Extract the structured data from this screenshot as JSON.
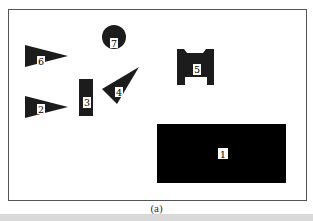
{
  "figure": {
    "caption": "(a)",
    "colors": {
      "frame": "#555555",
      "shape_fill": "#1c1c1c",
      "rect1_fill": "#000000",
      "label_bg": "#ffffff",
      "band": "#d9d9d9"
    },
    "shapes": [
      {
        "id": "1",
        "type": "rectangle",
        "label": "1"
      },
      {
        "id": "2",
        "type": "triangle",
        "label": "2"
      },
      {
        "id": "3",
        "type": "rectangle",
        "label": "3"
      },
      {
        "id": "4",
        "type": "triangle",
        "label": "4"
      },
      {
        "id": "5",
        "type": "notched-block",
        "label": "5"
      },
      {
        "id": "6",
        "type": "triangle",
        "label": "6"
      },
      {
        "id": "7",
        "type": "circle",
        "label": "7"
      }
    ]
  }
}
